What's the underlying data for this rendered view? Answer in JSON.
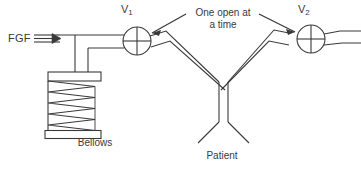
{
  "diagram": {
    "stroke_color": "#3a3a3a",
    "background_color": "#ffffff",
    "labels": {
      "fresh_gas_flow": "FGF",
      "valve_1": "V",
      "valve_1_subscript": "1",
      "valve_2": "V",
      "valve_2_subscript": "2",
      "annotation_line_1": "One open at",
      "annotation_line_2": "a time",
      "bellows": "Bellows",
      "patient": "Patient"
    },
    "components": {
      "fgf_arrow": "triple-line-flow-arrow",
      "valve_symbol": "circle-with-cross",
      "bellows_symbol": "accordion-folds",
      "bellows_fold_count": 8,
      "patient_connector": "y-piece"
    }
  }
}
